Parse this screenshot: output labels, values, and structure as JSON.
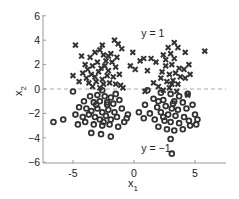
{
  "chart_data": {
    "type": "scatter",
    "title": "",
    "xlabel": "x1",
    "ylabel": "x2",
    "xlim": [
      -7.5,
      7.5
    ],
    "ylim": [
      -6,
      6
    ],
    "xticks": [
      -5,
      0,
      5
    ],
    "xtick_labels": [
      "-5",
      "0",
      "5"
    ],
    "yticks": [
      6,
      4,
      2,
      0,
      -2,
      -4,
      -6
    ],
    "ytick_labels": [
      "6",
      "4",
      "2",
      "0",
      "−2",
      "−4",
      "−6"
    ],
    "grid": false,
    "legend": null,
    "reference_line": {
      "y": 0,
      "style": "dashed",
      "color": "#aaaaaa"
    },
    "annotations": [
      {
        "text": "y = 1",
        "x": 0.6,
        "y": 4.6
      },
      {
        "text": "y = −1",
        "x": 0.6,
        "y": -4.8
      }
    ],
    "series": [
      {
        "name": "y = 1",
        "marker": "x",
        "color": "#333333",
        "points": [
          [
            -4.8,
            3.6
          ],
          [
            -2.6,
            3.6
          ],
          [
            -1.6,
            4.0
          ],
          [
            -1.3,
            3.7
          ],
          [
            -1.0,
            3.3
          ],
          [
            -4.3,
            2.7
          ],
          [
            -3.6,
            2.6
          ],
          [
            -3.2,
            3.0
          ],
          [
            -2.8,
            3.2
          ],
          [
            -2.5,
            2.8
          ],
          [
            -2.3,
            2.3
          ],
          [
            -1.9,
            2.9
          ],
          [
            -4.0,
            2.0
          ],
          [
            -3.8,
            1.6
          ],
          [
            -3.4,
            1.9
          ],
          [
            -3.0,
            2.2
          ],
          [
            -2.7,
            1.7
          ],
          [
            -2.4,
            1.9
          ],
          [
            -2.1,
            1.5
          ],
          [
            -1.8,
            2.2
          ],
          [
            -1.5,
            1.8
          ],
          [
            -5.0,
            1.1
          ],
          [
            -4.2,
            1.3
          ],
          [
            -3.9,
            0.9
          ],
          [
            -3.5,
            1.2
          ],
          [
            -3.2,
            1.0
          ],
          [
            -2.9,
            1.4
          ],
          [
            -2.6,
            0.8
          ],
          [
            -2.2,
            1.1
          ],
          [
            -1.7,
            1.0
          ],
          [
            -1.2,
            1.2
          ],
          [
            -3.7,
            0.5
          ],
          [
            -3.1,
            0.6
          ],
          [
            -2.5,
            0.4
          ],
          [
            -2.0,
            0.5
          ],
          [
            -1.5,
            0.4
          ],
          [
            -1.1,
            0.3
          ],
          [
            -0.9,
            0.1
          ],
          [
            -3.4,
            0.2
          ],
          [
            -2.8,
            0.1
          ],
          [
            -4.5,
            0.6
          ],
          [
            -1.4,
            2.6
          ],
          [
            -2.1,
            2.7
          ],
          [
            3.3,
            3.8
          ],
          [
            3.6,
            3.4
          ],
          [
            2.8,
            3.4
          ],
          [
            4.2,
            3.0
          ],
          [
            5.8,
            3.1
          ],
          [
            -0.1,
            3.0
          ],
          [
            0.8,
            2.5
          ],
          [
            0.5,
            2.3
          ],
          [
            1.4,
            2.5
          ],
          [
            1.8,
            2.2
          ],
          [
            2.4,
            2.8
          ],
          [
            3.0,
            2.9
          ],
          [
            3.3,
            2.5
          ],
          [
            3.1,
            2.0
          ],
          [
            2.6,
            1.9
          ],
          [
            3.7,
            1.7
          ],
          [
            4.1,
            1.6
          ],
          [
            4.5,
            2.0
          ],
          [
            4.6,
            1.2
          ],
          [
            0.1,
            1.6
          ],
          [
            -0.3,
            1.9
          ],
          [
            1.1,
            1.5
          ],
          [
            2.3,
            1.4
          ],
          [
            2.9,
            1.2
          ],
          [
            3.4,
            1.3
          ],
          [
            3.8,
            1.0
          ],
          [
            4.2,
            0.9
          ],
          [
            2.2,
            0.9
          ],
          [
            2.7,
            0.6
          ],
          [
            3.2,
            0.7
          ],
          [
            3.6,
            0.4
          ],
          [
            1.6,
            0.5
          ],
          [
            0.9,
            -0.2
          ],
          [
            2.0,
            0.2
          ],
          [
            2.9,
            0.1
          ],
          [
            3.5,
            -0.2
          ],
          [
            4.4,
            -0.5
          ],
          [
            2.4,
            -0.1
          ],
          [
            3.1,
            0.4
          ],
          [
            2.6,
            2.4
          ]
        ]
      },
      {
        "name": "y = −1",
        "marker": "o",
        "color": "#333333",
        "points": [
          [
            -5.0,
            -0.2
          ],
          [
            -2.6,
            -0.1
          ],
          [
            -3.6,
            -0.6
          ],
          [
            -3.0,
            -0.5
          ],
          [
            -2.4,
            -0.6
          ],
          [
            -1.9,
            -0.7
          ],
          [
            -1.5,
            -0.4
          ],
          [
            -1.2,
            -0.9
          ],
          [
            -4.1,
            -1.0
          ],
          [
            -3.3,
            -1.1
          ],
          [
            -2.8,
            -1.0
          ],
          [
            -2.2,
            -1.3
          ],
          [
            -1.7,
            -1.2
          ],
          [
            -4.5,
            -1.5
          ],
          [
            -3.9,
            -1.6
          ],
          [
            -3.5,
            -1.8
          ],
          [
            -3.0,
            -1.6
          ],
          [
            -2.6,
            -1.9
          ],
          [
            -2.1,
            -1.7
          ],
          [
            -1.6,
            -1.9
          ],
          [
            -1.0,
            -1.6
          ],
          [
            -0.5,
            -2.1
          ],
          [
            -4.8,
            -2.1
          ],
          [
            -4.2,
            -2.3
          ],
          [
            -3.7,
            -2.1
          ],
          [
            -3.2,
            -2.3
          ],
          [
            -2.8,
            -2.5
          ],
          [
            -2.3,
            -2.2
          ],
          [
            -1.9,
            -2.5
          ],
          [
            -1.4,
            -2.3
          ],
          [
            -0.6,
            -2.4
          ],
          [
            -6.6,
            -2.7
          ],
          [
            -5.8,
            -2.5
          ],
          [
            -4.6,
            -2.9
          ],
          [
            -4.0,
            -2.7
          ],
          [
            -3.3,
            -2.9
          ],
          [
            -2.6,
            -3.0
          ],
          [
            -2.0,
            -2.9
          ],
          [
            -1.3,
            -3.1
          ],
          [
            -3.5,
            -3.6
          ],
          [
            -2.7,
            -3.7
          ],
          [
            -1.9,
            -3.9
          ],
          [
            -2.2,
            -1.1
          ],
          [
            -3.1,
            -1.3
          ],
          [
            -2.5,
            -2.7
          ],
          [
            1.1,
            -0.1
          ],
          [
            2.2,
            -0.3
          ],
          [
            3.0,
            -0.4
          ],
          [
            3.7,
            -0.6
          ],
          [
            4.4,
            -0.4
          ],
          [
            1.6,
            -0.8
          ],
          [
            2.4,
            -0.9
          ],
          [
            3.3,
            -1.0
          ],
          [
            4.0,
            -1.1
          ],
          [
            4.8,
            -1.3
          ],
          [
            0.9,
            -1.3
          ],
          [
            1.9,
            -1.5
          ],
          [
            2.6,
            -1.4
          ],
          [
            3.1,
            -1.6
          ],
          [
            3.6,
            -1.7
          ],
          [
            4.3,
            -1.6
          ],
          [
            0.4,
            -1.9
          ],
          [
            1.3,
            -2.0
          ],
          [
            2.2,
            -1.9
          ],
          [
            2.8,
            -2.1
          ],
          [
            3.4,
            -2.2
          ],
          [
            4.1,
            -2.3
          ],
          [
            5.0,
            -2.1
          ],
          [
            -0.8,
            -2.7
          ],
          [
            0.8,
            -2.4
          ],
          [
            1.7,
            -2.5
          ],
          [
            2.5,
            -2.6
          ],
          [
            3.0,
            -2.7
          ],
          [
            3.7,
            -2.8
          ],
          [
            4.5,
            -2.6
          ],
          [
            5.2,
            -2.5
          ],
          [
            5.1,
            -2.9
          ],
          [
            2.0,
            -3.1
          ],
          [
            2.7,
            -3.3
          ],
          [
            3.3,
            -3.4
          ],
          [
            4.0,
            -3.3
          ],
          [
            4.6,
            -3.0
          ],
          [
            3.0,
            -4.1
          ],
          [
            3.1,
            -5.3
          ],
          [
            2.4,
            -2.3
          ],
          [
            3.2,
            -1.2
          ],
          [
            2.0,
            -1.0
          ]
        ]
      }
    ]
  }
}
